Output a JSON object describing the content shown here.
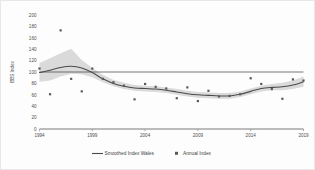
{
  "chart_data": {
    "type": "scatter",
    "title": "",
    "xlabel": "",
    "ylabel": "BBS Index",
    "xlim": [
      1994,
      2019
    ],
    "ylim": [
      0,
      200
    ],
    "grid": false,
    "legend_position": "bottom",
    "xticks": [
      "1994",
      "1999",
      "2004",
      "2009",
      "2014",
      "2019"
    ],
    "xtick_values": [
      1994,
      1999,
      2004,
      2009,
      2014,
      2019
    ],
    "yticks": [
      "0",
      "20",
      "40",
      "60",
      "80",
      "100",
      "120",
      "140",
      "160",
      "180",
      "200"
    ],
    "ytick_values": [
      0,
      20,
      40,
      60,
      80,
      100,
      120,
      140,
      160,
      180,
      200
    ],
    "reference_line": {
      "label": "Baseline 100",
      "value": 100
    },
    "x": [
      1994,
      1995,
      1996,
      1997,
      1998,
      1999,
      2000,
      2001,
      2002,
      2003,
      2004,
      2005,
      2006,
      2007,
      2008,
      2009,
      2010,
      2011,
      2012,
      2013,
      2014,
      2015,
      2016,
      2017,
      2018,
      2019
    ],
    "series": [
      {
        "name": "Annual Index",
        "type": "scatter",
        "marker": "square",
        "color": "#5a5a5a",
        "values": [
          106,
          61,
          173,
          88,
          66,
          106,
          88,
          82,
          76,
          52,
          79,
          74,
          71,
          54,
          73,
          49,
          67,
          57,
          58,
          61,
          89,
          79,
          70,
          53,
          87,
          85
        ]
      },
      {
        "name": "Smoothed Index Wales",
        "type": "line",
        "color": "#4a4a4a",
        "values": [
          99,
          103,
          108,
          110,
          107,
          99,
          88,
          80,
          75,
          72,
          71,
          70,
          68,
          65,
          62,
          60,
          59,
          58,
          58,
          61,
          66,
          71,
          73,
          74,
          77,
          83
        ]
      }
    ],
    "confidence_band": {
      "name": "Smoothed index confidence interval",
      "color": "#cfcfcf",
      "lower": [
        83,
        85,
        92,
        97,
        96,
        91,
        82,
        75,
        70,
        67,
        66,
        65,
        63,
        60,
        57,
        55,
        54,
        53,
        53,
        56,
        61,
        66,
        68,
        68,
        70,
        74
      ],
      "upper": [
        116,
        124,
        133,
        141,
        121,
        107,
        95,
        86,
        81,
        77,
        76,
        75,
        73,
        70,
        67,
        65,
        64,
        63,
        63,
        66,
        71,
        76,
        79,
        81,
        85,
        92
      ]
    }
  },
  "legend": {
    "items": [
      {
        "label": "Smoothed Index Wales",
        "marker": "line"
      },
      {
        "label": "Annual Index",
        "marker": "square"
      }
    ]
  }
}
